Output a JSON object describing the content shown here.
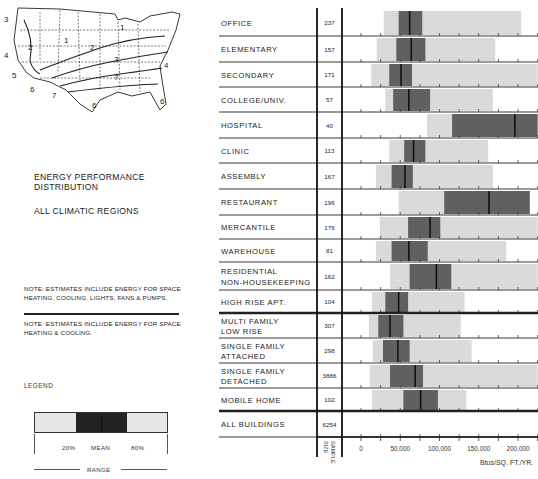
{
  "map": {
    "region_labels": [
      "1",
      "1",
      "2",
      "2",
      "3",
      "3",
      "4",
      "4",
      "5",
      "6",
      "6",
      "6",
      "7",
      "7"
    ]
  },
  "header": {
    "title_line1": "ENERGY PERFORMANCE",
    "title_line2": "DISTRIBUTION",
    "subtitle": "ALL CLIMATIC REGIONS"
  },
  "notes": {
    "note1": "NOTE: ESTIMATES INCLUDE ENERGY FOR SPACE HEATING, COOLING, LIGHTS, FANS & PUMPS.",
    "note2": "NOTE: ESTIMATES INCLUDE ENERGY FOR SPACE HEATING & COOLING."
  },
  "legend": {
    "label": "LEGEND",
    "p20": "20%",
    "mean": "MEAN",
    "p80": "80%",
    "range": "RANGE"
  },
  "chart_data": {
    "type": "bar",
    "subtype": "range-box",
    "xlabel": "Btus/SQ. FT./YR.",
    "sample_size_label": "SAMPLE SIZE",
    "xlim": [
      0,
      225000
    ],
    "x_ticks": [
      0,
      50000,
      100000,
      150000,
      200000
    ],
    "x_tick_labels": [
      "0",
      "50,000",
      "100,000",
      "150,000",
      "200,000"
    ],
    "minor_tick_step": 25000,
    "categories": [
      "OFFICE",
      "ELEMENTARY",
      "SECONDARY",
      "COLLEGE/UNIV.",
      "HOSPITAL",
      "CLINIC",
      "ASSEMBLY",
      "RESTAURANT",
      "MERCANTILE",
      "WAREHOUSE",
      "RESIDENTIAL NON-HOUSEKEEPING",
      "HIGH RISE APT.",
      "MULTI FAMILY LOW RISE",
      "SINGLE FAMILY ATTACHED",
      "SINGLE FAMILY DETACHED",
      "MOBILE HOME",
      "ALL BUILDINGS"
    ],
    "rows": [
      {
        "label": [
          "OFFICE"
        ],
        "n": "237",
        "min": 29000,
        "p20": 48000,
        "mean": 62000,
        "p80": 78000,
        "max": 204000,
        "group": 1
      },
      {
        "label": [
          "ELEMENTARY"
        ],
        "n": "157",
        "min": 20000,
        "p20": 45000,
        "mean": 64000,
        "p80": 82000,
        "max": 171000,
        "group": 1
      },
      {
        "label": [
          "SECONDARY"
        ],
        "n": "171",
        "min": 13000,
        "p20": 36000,
        "mean": 51000,
        "p80": 65000,
        "max": 225000,
        "group": 1
      },
      {
        "label": [
          "COLLEGE/UNIV."
        ],
        "n": "57",
        "min": 31000,
        "p20": 41000,
        "mean": 61000,
        "p80": 88000,
        "max": 168000,
        "group": 1
      },
      {
        "label": [
          "HOSPITAL"
        ],
        "n": "40",
        "min": 84000,
        "p20": 116000,
        "mean": 196000,
        "p80": 225000,
        "max": 225000,
        "group": 1
      },
      {
        "label": [
          "CLINIC"
        ],
        "n": "113",
        "min": 36000,
        "p20": 55000,
        "mean": 67000,
        "p80": 82000,
        "max": 162000,
        "group": 1
      },
      {
        "label": [
          "ASSEMBLY"
        ],
        "n": "167",
        "min": 19000,
        "p20": 39000,
        "mean": 56000,
        "p80": 66000,
        "max": 168000,
        "group": 1
      },
      {
        "label": [
          "RESTAURANT"
        ],
        "n": "196",
        "min": 48000,
        "p20": 106000,
        "mean": 163000,
        "p80": 215000,
        "max": 215000,
        "group": 1
      },
      {
        "label": [
          "MERCANTILE"
        ],
        "n": "176",
        "min": 24000,
        "p20": 60000,
        "mean": 88000,
        "p80": 101000,
        "max": 225000,
        "group": 1
      },
      {
        "label": [
          "WAREHOUSE"
        ],
        "n": "81",
        "min": 19000,
        "p20": 39000,
        "mean": 61000,
        "p80": 85000,
        "max": 185000,
        "group": 1
      },
      {
        "label": [
          "RESIDENTIAL",
          "NON-HOUSEKEEPING"
        ],
        "n": "162",
        "min": 37000,
        "p20": 62000,
        "mean": 96000,
        "p80": 115000,
        "max": 225000,
        "group": 1
      },
      {
        "label": [
          "HIGH RISE APT."
        ],
        "n": "104",
        "min": 14000,
        "p20": 31000,
        "mean": 48000,
        "p80": 60000,
        "max": 132000,
        "group": 1
      },
      {
        "label": [
          "MULTI FAMILY",
          "LOW RISE"
        ],
        "n": "307",
        "min": 10000,
        "p20": 22000,
        "mean": 37000,
        "p80": 54000,
        "max": 127000,
        "group": 2
      },
      {
        "label": [
          "SINGLE FAMILY",
          "ATTACHED"
        ],
        "n": "298",
        "min": 15000,
        "p20": 28000,
        "mean": 47000,
        "p80": 62000,
        "max": 141000,
        "group": 2
      },
      {
        "label": [
          "SINGLE FAMILY",
          "DETACHED"
        ],
        "n": "3886",
        "min": 11000,
        "p20": 37000,
        "mean": 69000,
        "p80": 79000,
        "max": 225000,
        "group": 2
      },
      {
        "label": [
          "MOBILE HOME"
        ],
        "n": "102",
        "min": 14000,
        "p20": 54000,
        "mean": 76000,
        "p80": 98000,
        "max": 134000,
        "group": 2
      },
      {
        "label": [
          "ALL BUILDINGS"
        ],
        "n": "6254",
        "min": null,
        "p20": null,
        "mean": null,
        "p80": null,
        "max": null,
        "group": 3
      }
    ],
    "colors": {
      "range": "#e6e6e6",
      "quintile": "#8a8a8a",
      "mean": "#111111",
      "lines": "#222222"
    },
    "grid": false,
    "legend_position": "bottom-left"
  }
}
